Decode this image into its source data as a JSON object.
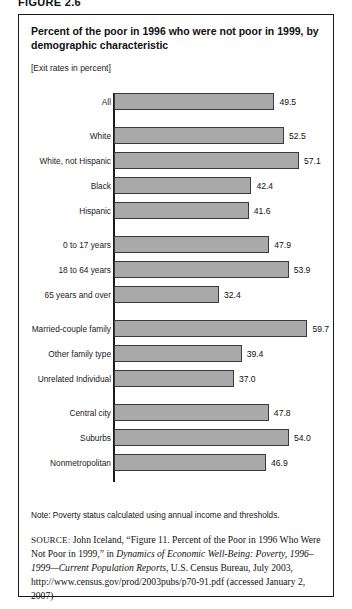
{
  "figure_number": "FIGURE 2.6",
  "panel": {
    "title": "Percent of the poor in 1996 who were not poor in 1999, by demographic characteristic",
    "subtitle": "[Exit rates in percent]",
    "note": "Note: Poverty status calculated using annual income and thresholds.",
    "source": {
      "label": "SOURCE:",
      "part1": " John Iceland, “Figure 11. Percent of the Poor in 1996 Who Were Not Poor in 1999,” in ",
      "italic1": "Dynamics of Economic Well-Being: Poverty, 1996–1999—Current Population Reports",
      "part2": ", U.S. Census Bureau, July 2003, http://www.census.gov/prod/2003pubs/p70-91.pdf (accessed January 2, 2007)"
    }
  },
  "chart_data": {
    "type": "bar",
    "orientation": "horizontal",
    "title": "Percent of the poor in 1996 who were not poor in 1999, by demographic characteristic",
    "subtitle": "[Exit rates in percent]",
    "xlabel": "",
    "ylabel": "",
    "xlim": [
      0,
      65
    ],
    "grid": false,
    "legend": false,
    "bar_color": "#a9a9a9",
    "bar_border_color": "#3a3a3a",
    "categories": [
      "All",
      "White",
      "White, not Hispanic",
      "Black",
      "Hispanic",
      "0 to 17 years",
      "18 to 64 years",
      "65 years and over",
      "Married-couple family",
      "Other family type",
      "Unrelated Individual",
      "Central city",
      "Suburbs",
      "Nonmetropolitan"
    ],
    "values": [
      49.5,
      52.5,
      57.1,
      42.4,
      41.6,
      47.9,
      53.9,
      32.4,
      59.7,
      39.4,
      37.0,
      47.8,
      54.0,
      46.9
    ],
    "value_labels": [
      "49.5",
      "52.5",
      "57.1",
      "42.4",
      "41.6",
      "47.9",
      "53.9",
      "32.4",
      "59.7",
      "39.4",
      "37.0",
      "47.8",
      "54.0",
      "46.9"
    ],
    "groups": [
      {
        "name": "total",
        "categories": [
          "All"
        ]
      },
      {
        "name": "race-and-ethnicity",
        "categories": [
          "White",
          "White, not Hispanic",
          "Black",
          "Hispanic"
        ]
      },
      {
        "name": "age",
        "categories": [
          "0 to 17 years",
          "18 to 64 years",
          "65 years and over"
        ]
      },
      {
        "name": "family-type",
        "categories": [
          "Married-couple family",
          "Other family type",
          "Unrelated Individual"
        ]
      },
      {
        "name": "residence",
        "categories": [
          "Central city",
          "Suburbs",
          "Nonmetropolitan"
        ]
      }
    ]
  }
}
